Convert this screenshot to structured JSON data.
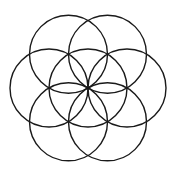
{
  "diagram": {
    "stroke_color": "#1a1a1a",
    "background": "#ffffff",
    "center": [
      88,
      88
    ],
    "radius": 39,
    "circles": [
      {
        "name": "center",
        "cx": 88,
        "cy": 88
      },
      {
        "name": "top-left",
        "cx": 68.5,
        "cy": 54.2
      },
      {
        "name": "top-right",
        "cx": 107.5,
        "cy": 54.2
      },
      {
        "name": "right",
        "cx": 127,
        "cy": 88
      },
      {
        "name": "bottom-right",
        "cx": 107.5,
        "cy": 121.8
      },
      {
        "name": "bottom-left",
        "cx": 68.5,
        "cy": 121.8
      },
      {
        "name": "left",
        "cx": 49,
        "cy": 88
      }
    ]
  }
}
